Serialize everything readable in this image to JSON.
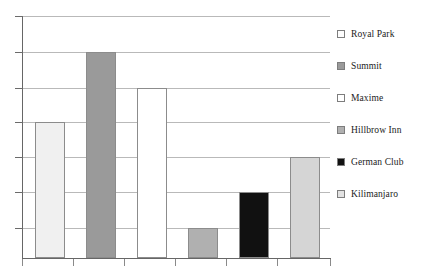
{
  "chart_data": {
    "type": "bar",
    "title": "",
    "xlabel": "",
    "ylabel": "",
    "grid": true,
    "legend_position": "right",
    "ylim": [
      0,
      7
    ],
    "y_gridline_values": [
      7,
      6,
      5,
      4,
      3,
      2,
      1,
      0
    ],
    "y_tick_labels": [
      "",
      "",
      "",
      "",
      "",
      "",
      "",
      ""
    ],
    "x_tick_labels": [
      "",
      "",
      "",
      "",
      "",
      "",
      ""
    ],
    "categories": [
      "Royal Park",
      "Summit",
      "Maxime",
      "Hillbrow Inn",
      "German Club",
      "Kilimanjaro"
    ],
    "values": [
      3.9,
      6,
      5,
      0.9,
      1.9,
      2.9
    ],
    "series": [
      {
        "name": "Hotels",
        "values": [
          3.9,
          6,
          5,
          0.9,
          1.9,
          2.9
        ]
      }
    ],
    "bar_colors": [
      "#f0f0f0",
      "#9a9a9a",
      "#ffffff",
      "#b0b0b0",
      "#111111",
      "#d5d5d5"
    ],
    "bar_edge_color": "#8c8c8c",
    "axis_color": "#666666",
    "gridline_color": "#b9b9b9",
    "background_color": "#ffffff"
  },
  "legend": {
    "items": [
      {
        "label": "Royal Park",
        "swatch": "#fdfdfd",
        "icon": "legend-swatch-icon"
      },
      {
        "label": "Summit",
        "swatch": "#9a9a9a",
        "icon": "legend-swatch-icon"
      },
      {
        "label": "Maxime",
        "swatch": "#ffffff",
        "icon": "legend-swatch-icon"
      },
      {
        "label": "Hillbrow Inn",
        "swatch": "#b0b0b0",
        "icon": "legend-swatch-icon"
      },
      {
        "label": "German Club",
        "swatch": "#111111",
        "icon": "legend-swatch-icon"
      },
      {
        "label": "Kilimanjaro",
        "swatch": "#e2e2e2",
        "icon": "legend-swatch-icon"
      }
    ]
  },
  "layout": {
    "plot_left": 22,
    "plot_top": 16,
    "plot_width": 308,
    "plot_height": 242,
    "baseline_y": 258,
    "gridline_y": [
      16,
      52,
      88,
      122,
      157,
      192,
      228
    ],
    "x_tick_x": [
      22,
      73,
      124,
      175,
      226,
      277,
      330
    ],
    "bars": [
      {
        "x": 35,
        "width": 30,
        "top": 122
      },
      {
        "x": 86,
        "width": 30,
        "top": 52
      },
      {
        "x": 137,
        "width": 30,
        "top": 88
      },
      {
        "x": 188,
        "width": 30,
        "top": 228
      },
      {
        "x": 239,
        "width": 30,
        "top": 192
      },
      {
        "x": 290,
        "width": 30,
        "top": 157
      }
    ],
    "legend_item_y": [
      12,
      44,
      76,
      108,
      140,
      172
    ]
  }
}
